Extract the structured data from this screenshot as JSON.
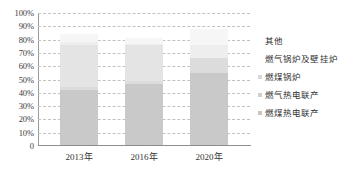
{
  "chart_data": {
    "type": "bar",
    "stacked": true,
    "title": "",
    "xlabel": "",
    "ylabel": "",
    "categories": [
      "2013年",
      "2016年",
      "2020年"
    ],
    "ylim": [
      0,
      100
    ],
    "ytick_labels": [
      "100%",
      "90%",
      "80%",
      "70%",
      "60%",
      "50%",
      "40%",
      "30%",
      "20%",
      "10%",
      "0"
    ],
    "ytick_values": [
      100,
      90,
      80,
      70,
      60,
      50,
      40,
      30,
      20,
      10,
      0
    ],
    "grid": true,
    "grid_style": "dashed-horizontal",
    "legend_position": "right",
    "series": [
      {
        "name": "燃煤热电联产",
        "color": "#c9c9c9",
        "values": [
          42,
          47,
          55
        ]
      },
      {
        "name": "燃气热电联产",
        "color": "#dcdcdc",
        "values": [
          2,
          2,
          11
        ]
      },
      {
        "name": "燃煤锅炉",
        "color": "#e4e4e4",
        "values": [
          32,
          27,
          0
        ]
      },
      {
        "name": "燃气锅炉及壁挂炉",
        "color": "#eeeeee",
        "values": [
          2,
          1,
          10
        ]
      },
      {
        "name": "其他",
        "color": "#f6f6f6",
        "values": [
          6,
          4,
          12
        ]
      }
    ]
  },
  "axis": {
    "y_ticks": [
      {
        "label": "100%",
        "value": 100
      },
      {
        "label": "90%",
        "value": 90
      },
      {
        "label": "80%",
        "value": 80
      },
      {
        "label": "70%",
        "value": 70
      },
      {
        "label": "60%",
        "value": 60
      },
      {
        "label": "50%",
        "value": 50
      },
      {
        "label": "40%",
        "value": 40
      },
      {
        "label": "30%",
        "value": 30
      },
      {
        "label": "20%",
        "value": 20
      },
      {
        "label": "10%",
        "value": 10
      },
      {
        "label": "0",
        "value": 0
      }
    ],
    "x_ticks": [
      "2013年",
      "2016年",
      "2020年"
    ]
  },
  "legend": {
    "items": [
      {
        "label": "其他",
        "color": "#f6f6f6",
        "swatch_visible": false
      },
      {
        "label": "燃气锅炉及壁挂炉",
        "color": "#eeeeee",
        "swatch_visible": false
      },
      {
        "label": "燃煤锅炉",
        "color": "#d8d8d8",
        "swatch_visible": true
      },
      {
        "label": "燃气热电联产",
        "color": "#cfcfcf",
        "swatch_visible": true
      },
      {
        "label": "燃煤热电联产",
        "color": "#c6c6c6",
        "swatch_visible": true
      }
    ]
  },
  "colors": {
    "grid": "#c2c2c2",
    "axis": "#8e8e8e",
    "text": "#333333",
    "background": "#ffffff"
  }
}
